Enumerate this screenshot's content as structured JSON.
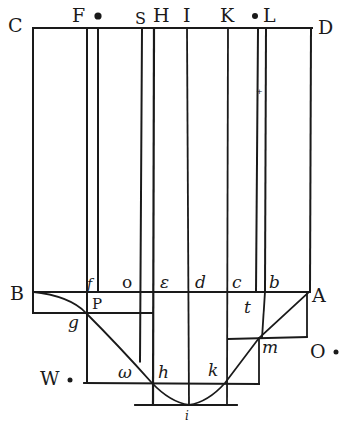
{
  "figure": {
    "colors": {
      "ink": "#1a1a1a",
      "paper": "#ffffff"
    }
  },
  "labels": {
    "C": "C",
    "F": "F",
    "S": "S",
    "H": "H",
    "I": "I",
    "K": "K",
    "L": "L",
    "D": "D",
    "B": "B",
    "A": "A",
    "f": "f",
    "o": "o",
    "epsilon": "ε",
    "d": "d",
    "c": "c",
    "b": "b",
    "P": "P",
    "t": "t",
    "g": "g",
    "m": "m",
    "O": "O",
    "W": "W",
    "omega": "ω",
    "h": "h",
    "k": "k",
    "i": "i"
  }
}
